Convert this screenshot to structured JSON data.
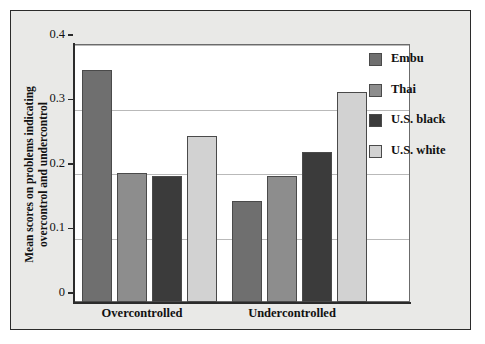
{
  "chart_data": {
    "type": "bar",
    "title": "",
    "xlabel": "",
    "ylabel": "Mean scores on problems indicating overcontrol and undercontrol",
    "ylabel_line1": "Mean scores on problems indicating",
    "ylabel_line2": "overcontrol and undercontrol",
    "categories": [
      "Overcontrolled",
      "Undercontrolled"
    ],
    "ylim": [
      0,
      0.4
    ],
    "yticks": [
      "0",
      "0.1",
      "0.2",
      "0.3",
      "0.4"
    ],
    "ytick_values": [
      0,
      0.1,
      0.2,
      0.3,
      0.4
    ],
    "grid": true,
    "legend_position": "right",
    "series": [
      {
        "name": "Embu",
        "color": "#6f6f6f",
        "values": [
          0.36,
          0.157
        ]
      },
      {
        "name": "Thai",
        "color": "#8d8d8d",
        "values": [
          0.2,
          0.196
        ]
      },
      {
        "name": "U.S. black",
        "color": "#3b3b3b",
        "values": [
          0.195,
          0.233
        ]
      },
      {
        "name": "U.S. white",
        "color": "#d2d2d2",
        "values": [
          0.258,
          0.325
        ]
      }
    ]
  },
  "legend": {
    "items": [
      {
        "label": "Embu",
        "color": "#6f6f6f"
      },
      {
        "label": "Thai",
        "color": "#8d8d8d"
      },
      {
        "label": "U.S. black",
        "color": "#3b3b3b"
      },
      {
        "label": "U.S. white",
        "color": "#d2d2d2"
      }
    ]
  },
  "colors": {
    "panel_background": "#e9e9e7",
    "plot_background": "#ffffff",
    "axis": "#2b2b2b",
    "gridline": "#b9b9b9",
    "bar_outline": "#4a4a4a"
  }
}
